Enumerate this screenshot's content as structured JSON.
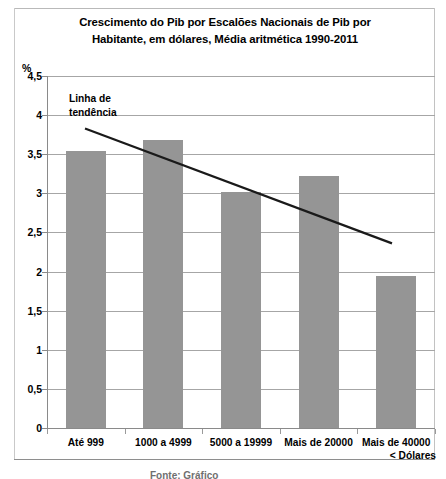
{
  "chart_data": {
    "type": "bar",
    "title": "Crescimento do Pib por Escalões Nacionais de Pib por Habitante, em dólares, Média aritmética 1990-2011",
    "title_line1": "Crescimento do Pib por Escalões Nacionais de Pib por",
    "title_line2": "Habitante, em dólares, Média aritmética 1990-2011",
    "xlabel": "< Dólares",
    "ylabel": "%",
    "ylim": [
      0,
      4.5
    ],
    "ytick_step": 0.5,
    "grid": true,
    "legend": "none",
    "decimal_separator": ",",
    "bar_color": "#959595",
    "trendline_color": "#1a1a1a",
    "categories": [
      "Até 999",
      "1000 a 4999",
      "5000 a 19999",
      "Mais de 20000",
      "Mais de 40000"
    ],
    "values": [
      3.54,
      3.68,
      3.02,
      3.22,
      1.94
    ],
    "ytick_labels": [
      "0",
      "0,5",
      "1",
      "1,5",
      "2",
      "2,5",
      "3",
      "3,5",
      "4",
      "4,5"
    ],
    "ytick_values": [
      0,
      0.5,
      1,
      1.5,
      2,
      2.5,
      3,
      3.5,
      4,
      4.5
    ],
    "annotations": [
      {
        "name": "trendline-label",
        "text": "Linha de tendência",
        "line1": "Linha de",
        "line2": "tendência"
      }
    ],
    "trendline": {
      "type": "linear",
      "x_start_px": 85,
      "y_start_value": 3.83,
      "x_end_px": 392,
      "y_end_value": 2.36
    }
  },
  "footer": {
    "clipped_text": "Fonte: Gráfico"
  }
}
